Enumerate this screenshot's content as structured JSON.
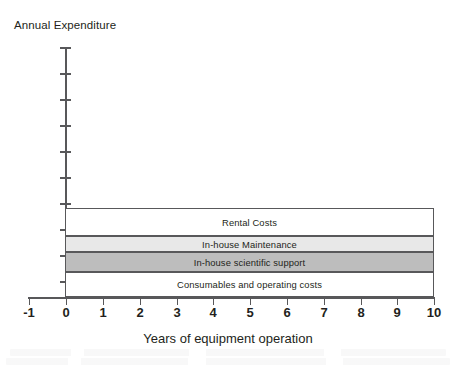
{
  "chart_data": {
    "type": "bar",
    "orientation": "horizontal-stacked-band",
    "title": "",
    "xlabel": "Years of equipment operation",
    "ylabel": "Annual Expenditure",
    "xlim": [
      -1,
      10
    ],
    "x_ticks": [
      "-1",
      "0",
      "1",
      "2",
      "3",
      "4",
      "5",
      "6",
      "7",
      "8",
      "9",
      "10"
    ],
    "y_ticks_labeled": false,
    "y_tick_count": 10,
    "grid": false,
    "legend": "none (in-band labels)",
    "bar_span_years": [
      0,
      10
    ],
    "categories": [
      "Rental Costs",
      "In-house Maintenance",
      "In-house scientific support",
      "Consumables and operating costs"
    ],
    "series": [
      {
        "name": "Rental Costs",
        "label": "Rental Costs",
        "fill": "#ffffff",
        "top_px": 208,
        "height_px": 28,
        "relative_share": 0.315
      },
      {
        "name": "In-house Maintenance",
        "label": "In-house Maintenance",
        "fill": "#e8e8e8",
        "top_px": 236,
        "height_px": 16,
        "relative_share": 0.18
      },
      {
        "name": "In-house scientific support",
        "label": "In-house scientific support",
        "fill": "#bdbdbd",
        "top_px": 252,
        "height_px": 20,
        "relative_share": 0.225
      },
      {
        "name": "Consumables and operating costs",
        "label": "Consumables and operating costs",
        "fill": "#ffffff",
        "top_px": 272,
        "height_px": 25,
        "relative_share": 0.28
      }
    ]
  },
  "axes": {
    "y_title": "Annual Expenditure",
    "x_title": "Years of equipment operation",
    "axis_color": "#58585a",
    "y_tick_positions_px": [
      47,
      73,
      99,
      125,
      151,
      177,
      203,
      229,
      255,
      281
    ],
    "x_tick_values": [
      "-1",
      "0",
      "1",
      "2",
      "3",
      "4",
      "5",
      "6",
      "7",
      "8",
      "9",
      "10"
    ],
    "x_tick_positions_px": [
      29,
      66,
      103,
      140,
      177,
      213,
      250,
      287,
      324,
      361,
      397,
      434
    ]
  }
}
